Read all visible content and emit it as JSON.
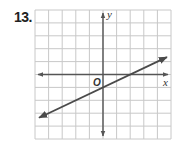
{
  "problem": {
    "number": "13."
  },
  "chart_data": {
    "type": "line",
    "title": "",
    "xlabel": "x",
    "ylabel": "y",
    "origin_label": "O",
    "xlim": [
      -5,
      5
    ],
    "ylim": [
      -5,
      5
    ],
    "grid": true,
    "grid_step": 1,
    "legend": null,
    "series": [
      {
        "name": "line",
        "equation": "y = 0.5x - 1",
        "slope": 0.5,
        "y_intercept": -1,
        "x_intercept": 2,
        "points": [
          [
            -5,
            -3.5
          ],
          [
            0,
            -1
          ],
          [
            2,
            0
          ],
          [
            5,
            1.5
          ]
        ],
        "arrows_both_ends": true
      }
    ]
  },
  "colors": {
    "grid": "#c8c8c8",
    "axis": "#555555",
    "line": "#4a4a4a"
  }
}
